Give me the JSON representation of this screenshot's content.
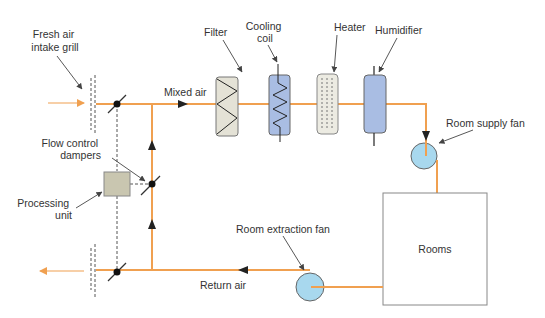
{
  "diagram": {
    "colors": {
      "duct": "#f0a050",
      "leader": "#444444",
      "dashed": "#555555",
      "filter_fill": "#e4e2d6",
      "coil_fill": "#a9bde3",
      "heater_fill": "#ecebe2",
      "humidifier_fill": "#a9bde3",
      "fan_fill": "#a8d8ee",
      "processing_fill": "#c9c6b0",
      "box_stroke": "#777777"
    },
    "labels": {
      "fresh_air_intake_grill_line1": "Fresh air",
      "fresh_air_intake_grill_line2": "intake grill",
      "mixed_air": "Mixed air",
      "filter": "Filter",
      "cooling_coil_line1": "Cooling",
      "cooling_coil_line2": "coil",
      "heater": "Heater",
      "humidifier": "Humidifier",
      "room_supply_fan": "Room supply fan",
      "flow_control_dampers_line1": "Flow control",
      "flow_control_dampers_line2": "dampers",
      "processing_unit_line1": "Processing",
      "processing_unit_line2": "unit",
      "rooms": "Rooms",
      "room_extraction_fan": "Room extraction fan",
      "return_air": "Return air"
    }
  }
}
